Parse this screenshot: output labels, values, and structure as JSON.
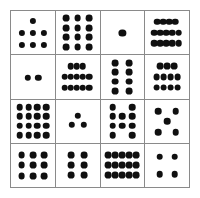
{
  "figure": {
    "kind": "dice-pip-grid",
    "rows": 4,
    "columns": 4,
    "background_color": "#ffffff",
    "border_color": "#8a8a8a",
    "pip_color": "#101010"
  },
  "chart_data": {
    "type": "table",
    "title": "",
    "subtitle": "",
    "xlabel": "",
    "ylabel": "",
    "grid": true,
    "legend": null,
    "categories": [
      "col-1",
      "col-2",
      "col-3",
      "col-4"
    ],
    "row_labels": [
      "row-1",
      "row-2",
      "row-3",
      "row-4"
    ],
    "series": [
      {
        "name": "row-1",
        "values": [
          7,
          12,
          1,
          14
        ]
      },
      {
        "name": "row-2",
        "values": [
          2,
          13,
          8,
          11
        ]
      },
      {
        "name": "row-3",
        "values": [
          16,
          3,
          10,
          5
        ]
      },
      {
        "name": "row-4",
        "values": [
          9,
          6,
          15,
          4
        ]
      }
    ],
    "values_flat": [
      7,
      12,
      1,
      14,
      2,
      13,
      8,
      11,
      16,
      3,
      10,
      5,
      9,
      6,
      15,
      4
    ],
    "total_pips": 126
  },
  "cells": [
    {
      "id": "cell-r1c1",
      "count": "7",
      "layout": "1-3-3",
      "pip_radius": 3.1,
      "pips": [
        [
          50,
          22
        ],
        [
          24,
          50
        ],
        [
          50,
          50
        ],
        [
          76,
          50
        ],
        [
          24,
          78
        ],
        [
          50,
          78
        ],
        [
          76,
          78
        ]
      ]
    },
    {
      "id": "cell-r1c2",
      "count": "12",
      "layout": "grid-3x4",
      "pip_radius": 3.4,
      "pips": [
        [
          23,
          17
        ],
        [
          50,
          17
        ],
        [
          77,
          17
        ],
        [
          23,
          39
        ],
        [
          50,
          39
        ],
        [
          77,
          39
        ],
        [
          23,
          61
        ],
        [
          50,
          61
        ],
        [
          77,
          61
        ],
        [
          23,
          83
        ],
        [
          50,
          83
        ],
        [
          77,
          83
        ]
      ]
    },
    {
      "id": "cell-r1c3",
      "count": "1",
      "layout": "center",
      "pip_radius": 3.6,
      "pips": [
        [
          50,
          50
        ]
      ]
    },
    {
      "id": "cell-r1c4",
      "count": "14",
      "layout": "4-5-5",
      "pip_radius": 3.3,
      "pips": [
        [
          27,
          25
        ],
        [
          41,
          25
        ],
        [
          55,
          25
        ],
        [
          69,
          25
        ],
        [
          20,
          50
        ],
        [
          34,
          50
        ],
        [
          48,
          50
        ],
        [
          62,
          50
        ],
        [
          76,
          50
        ],
        [
          20,
          75
        ],
        [
          34,
          75
        ],
        [
          48,
          75
        ],
        [
          62,
          75
        ],
        [
          76,
          75
        ]
      ]
    },
    {
      "id": "cell-r2c1",
      "count": "2",
      "layout": "pair-horizontal",
      "pip_radius": 3.2,
      "pips": [
        [
          38,
          52
        ],
        [
          62,
          52
        ]
      ]
    },
    {
      "id": "cell-r2c2",
      "count": "13",
      "layout": "3-5-5",
      "pip_radius": 3.3,
      "pips": [
        [
          34,
          25
        ],
        [
          48,
          25
        ],
        [
          62,
          25
        ],
        [
          20,
          50
        ],
        [
          34,
          50
        ],
        [
          48,
          50
        ],
        [
          62,
          50
        ],
        [
          76,
          50
        ],
        [
          20,
          75
        ],
        [
          34,
          75
        ],
        [
          48,
          75
        ],
        [
          62,
          75
        ],
        [
          76,
          75
        ]
      ]
    },
    {
      "id": "cell-r2c3",
      "count": "8",
      "layout": "grid-2x4",
      "pip_radius": 3.4,
      "pips": [
        [
          34,
          18
        ],
        [
          66,
          18
        ],
        [
          34,
          39
        ],
        [
          66,
          39
        ],
        [
          34,
          61
        ],
        [
          66,
          61
        ],
        [
          34,
          82
        ],
        [
          66,
          82
        ]
      ]
    },
    {
      "id": "cell-r2c4",
      "count": "11",
      "layout": "3-4-4",
      "pip_radius": 3.4,
      "pips": [
        [
          34,
          25
        ],
        [
          50,
          25
        ],
        [
          66,
          25
        ],
        [
          26,
          50
        ],
        [
          42,
          50
        ],
        [
          58,
          50
        ],
        [
          74,
          50
        ],
        [
          26,
          75
        ],
        [
          42,
          75
        ],
        [
          58,
          75
        ],
        [
          74,
          75
        ]
      ]
    },
    {
      "id": "cell-r3c1",
      "count": "16",
      "layout": "grid-4x4",
      "pip_radius": 3.3,
      "pips": [
        [
          20,
          18
        ],
        [
          40,
          18
        ],
        [
          60,
          18
        ],
        [
          80,
          18
        ],
        [
          20,
          39
        ],
        [
          40,
          39
        ],
        [
          60,
          39
        ],
        [
          80,
          39
        ],
        [
          20,
          61
        ],
        [
          40,
          61
        ],
        [
          60,
          61
        ],
        [
          80,
          61
        ],
        [
          20,
          82
        ],
        [
          40,
          82
        ],
        [
          60,
          82
        ],
        [
          80,
          82
        ]
      ]
    },
    {
      "id": "cell-r3c2",
      "count": "3",
      "layout": "triangle",
      "pip_radius": 3.2,
      "pips": [
        [
          50,
          38
        ],
        [
          36,
          58
        ],
        [
          64,
          58
        ]
      ]
    },
    {
      "id": "cell-r3c3",
      "count": "10",
      "layout": "2-3-3-2",
      "pip_radius": 3.3,
      "pips": [
        [
          28,
          18
        ],
        [
          72,
          18
        ],
        [
          28,
          39
        ],
        [
          50,
          39
        ],
        [
          72,
          39
        ],
        [
          28,
          61
        ],
        [
          50,
          61
        ],
        [
          72,
          61
        ],
        [
          28,
          82
        ],
        [
          72,
          82
        ]
      ]
    },
    {
      "id": "cell-r3c4",
      "count": "5",
      "layout": "quincunx",
      "pip_radius": 3.3,
      "pips": [
        [
          30,
          27
        ],
        [
          70,
          27
        ],
        [
          50,
          50
        ],
        [
          30,
          76
        ],
        [
          70,
          76
        ]
      ]
    },
    {
      "id": "cell-r4c1",
      "count": "9",
      "layout": "grid-3x3",
      "pip_radius": 3.4,
      "pips": [
        [
          24,
          26
        ],
        [
          50,
          26
        ],
        [
          76,
          26
        ],
        [
          24,
          50
        ],
        [
          50,
          50
        ],
        [
          76,
          50
        ],
        [
          24,
          74
        ],
        [
          50,
          74
        ],
        [
          76,
          74
        ]
      ]
    },
    {
      "id": "cell-r4c2",
      "count": "6",
      "layout": "grid-2x3",
      "pip_radius": 3.4,
      "pips": [
        [
          35,
          27
        ],
        [
          65,
          27
        ],
        [
          35,
          50
        ],
        [
          65,
          50
        ],
        [
          35,
          73
        ],
        [
          65,
          73
        ]
      ]
    },
    {
      "id": "cell-r4c3",
      "count": "15",
      "layout": "grid-5x3",
      "pip_radius": 3.4,
      "pips": [
        [
          18,
          27
        ],
        [
          34,
          27
        ],
        [
          50,
          27
        ],
        [
          66,
          27
        ],
        [
          82,
          27
        ],
        [
          18,
          50
        ],
        [
          34,
          50
        ],
        [
          50,
          50
        ],
        [
          66,
          50
        ],
        [
          82,
          50
        ],
        [
          18,
          73
        ],
        [
          34,
          73
        ],
        [
          50,
          73
        ],
        [
          66,
          73
        ],
        [
          82,
          73
        ]
      ]
    },
    {
      "id": "cell-r4c4",
      "count": "4",
      "layout": "square",
      "pip_radius": 3.3,
      "pips": [
        [
          33,
          30
        ],
        [
          67,
          30
        ],
        [
          33,
          70
        ],
        [
          67,
          70
        ]
      ]
    }
  ]
}
